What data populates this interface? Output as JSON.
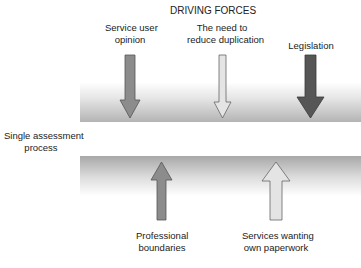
{
  "title": "DRIVING FORCES",
  "center_label": "Single assessment process",
  "center_label_lines": [
    "Single assessment",
    "process"
  ],
  "driving_forces": [
    {
      "lines": [
        "Service user",
        "opinion"
      ],
      "direction": "down",
      "color": "#8c8c8c"
    },
    {
      "lines": [
        "The need to",
        "reduce duplication"
      ],
      "direction": "down",
      "color": "#e2e2e2"
    },
    {
      "lines": [
        "Legislation"
      ],
      "direction": "down",
      "color": "#565656"
    }
  ],
  "restraining_forces": [
    {
      "lines": [
        "Professional",
        "boundaries"
      ],
      "direction": "up",
      "color": "#8c8c8c"
    },
    {
      "lines": [
        "Services wanting",
        "own paperwork"
      ],
      "direction": "up",
      "color": "#e2e2e2"
    }
  ]
}
